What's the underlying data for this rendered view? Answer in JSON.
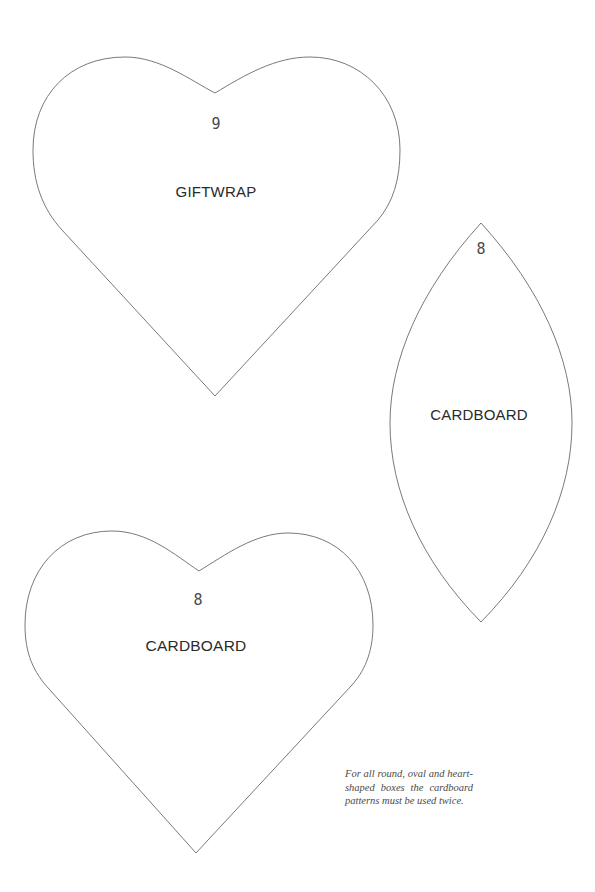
{
  "patterns": [
    {
      "shape": "heart",
      "number": "9",
      "material": "GIFTWRAP"
    },
    {
      "shape": "leaf-oval",
      "number": "8",
      "material": "CARDBOARD"
    },
    {
      "shape": "heart",
      "number": "8",
      "material": "CARDBOARD"
    }
  ],
  "note": "For all round, oval and heart-shaped boxes the cardboard patterns must be used twice.",
  "colors": {
    "outline": "#6a6a6a",
    "text": "#2a2a2a",
    "background": "#ffffff"
  }
}
